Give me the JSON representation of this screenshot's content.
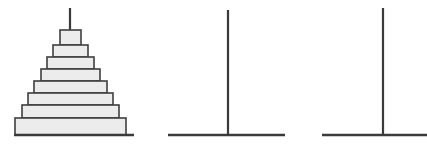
{
  "canvas": {
    "width": 427,
    "height": 147,
    "background_color": "#ffffff"
  },
  "style": {
    "tier_fill_color": "#ececec",
    "tier_stroke_color": "#3f3f3f",
    "tier_stroke_width": 1.6,
    "ground_line_color": "#3a3a3a",
    "ground_line_width": 2.4,
    "pole_color": "#3a3a3a",
    "pole_width": 2.2
  },
  "figures": [
    {
      "id": "figure-1",
      "name": "stepped-pyramid-with-pole",
      "description": "Eight-tier stepped pyramid (ziggurat) surmounted by a thin vertical pole",
      "ground_line": {
        "x1": 14,
        "x2": 134,
        "y": 135
      },
      "pole": {
        "x": 70,
        "y_top": 8,
        "y_bottom": 31
      },
      "tier_count": 8,
      "tiers": [
        {
          "index": 1,
          "label": "finial-box",
          "x": 60,
          "width": 21,
          "y": 30,
          "height": 15
        },
        {
          "index": 2,
          "label": "tier-7",
          "x": 53,
          "width": 35,
          "y": 45,
          "height": 12
        },
        {
          "index": 3,
          "label": "tier-6",
          "x": 47,
          "width": 47,
          "y": 57,
          "height": 12
        },
        {
          "index": 4,
          "label": "tier-5",
          "x": 41,
          "width": 59,
          "y": 69,
          "height": 12
        },
        {
          "index": 5,
          "label": "tier-4",
          "x": 34,
          "width": 73,
          "y": 81,
          "height": 12
        },
        {
          "index": 6,
          "label": "tier-3",
          "x": 28,
          "width": 85,
          "y": 93,
          "height": 12
        },
        {
          "index": 7,
          "label": "tier-2",
          "x": 22,
          "width": 97,
          "y": 105,
          "height": 13
        },
        {
          "index": 8,
          "label": "tier-1-base",
          "x": 15,
          "width": 111,
          "y": 118,
          "height": 17
        }
      ]
    },
    {
      "id": "figure-2",
      "name": "pole-on-ground-center",
      "description": "Bare vertical pole standing on a horizontal ground line, pyramid removed",
      "ground_line": {
        "x1": 168,
        "x2": 285,
        "y": 135
      },
      "pole": {
        "x": 228,
        "y_top": 10,
        "y_bottom": 135
      },
      "tier_count": 0,
      "tiers": []
    },
    {
      "id": "figure-3",
      "name": "pole-on-ground-right",
      "description": "Bare vertical pole standing on a horizontal ground line extending past the right edge",
      "ground_line": {
        "x1": 322,
        "x2": 427,
        "y": 135
      },
      "pole": {
        "x": 383,
        "y_top": 8,
        "y_bottom": 135
      },
      "tier_count": 0,
      "tiers": []
    }
  ]
}
